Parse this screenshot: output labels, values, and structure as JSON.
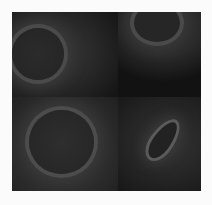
{
  "image": {
    "description": "Grayscale microscopy montage of four cells in a 2x2 grid",
    "panels": [
      {
        "position": "top-left",
        "subject": "round cell"
      },
      {
        "position": "top-right",
        "subject": "oval cell partially cropped at top"
      },
      {
        "position": "bottom-left",
        "subject": "round cell"
      },
      {
        "position": "bottom-right",
        "subject": "elongated sickle-shaped cell"
      }
    ],
    "colors": {
      "background": "#fbfbfb",
      "figure": "#1a1a1a",
      "cell_halo": "#4a4a4a"
    }
  }
}
